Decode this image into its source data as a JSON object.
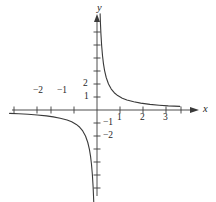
{
  "figure": {
    "background_color": "#ffffff",
    "stroke_color": "#3a3a3a",
    "text_color": "#262626"
  },
  "axes": {
    "x_axis_label": "x",
    "y_axis_label": "y",
    "origin_px": {
      "x": 97,
      "y": 110
    },
    "unit_px": {
      "x": 23.0,
      "y": 13.0
    },
    "x_ticks": [
      {
        "value": -3.6,
        "label": ""
      },
      {
        "value": -2.6,
        "label": ""
      },
      {
        "value": -2,
        "label": "−2"
      },
      {
        "value": -1,
        "label": "−1"
      },
      {
        "value": 1,
        "label": "1"
      },
      {
        "value": 2,
        "label": "2"
      },
      {
        "value": 3,
        "label": "3"
      },
      {
        "value": 3.65,
        "label": ""
      }
    ],
    "y_ticks": [
      {
        "value": 6,
        "label": ""
      },
      {
        "value": 5,
        "label": ""
      },
      {
        "value": 4,
        "label": ""
      },
      {
        "value": 3,
        "label": ""
      },
      {
        "value": 2,
        "label": "2"
      },
      {
        "value": 1,
        "label": "1"
      },
      {
        "value": -1,
        "label": "−1"
      },
      {
        "value": -2,
        "label": "−2"
      },
      {
        "value": -3,
        "label": ""
      },
      {
        "value": -4,
        "label": ""
      },
      {
        "value": -5,
        "label": ""
      },
      {
        "value": -6,
        "label": ""
      }
    ]
  },
  "chart_data": {
    "type": "line",
    "title": "",
    "subtitle": "",
    "xlabel": "x",
    "ylabel": "y",
    "xlim": [
      -4.2,
      4.6
    ],
    "ylim": [
      -7.3,
      7.3
    ],
    "grid": false,
    "legend": null,
    "axis_style": "cartesian-arrows",
    "function": "y = 1/x",
    "series": [
      {
        "name": "right-branch",
        "comment": "upper-right hyperbola branch, x > 0, asymptotic to both axes",
        "x": [
          0.135,
          0.15,
          0.17,
          0.2,
          0.24,
          0.28,
          0.33,
          0.4,
          0.5,
          0.62,
          0.75,
          0.9,
          1.1,
          1.3,
          1.6,
          1.9,
          2.3,
          2.7,
          3.1,
          3.6
        ],
        "y": [
          7.4,
          6.67,
          5.88,
          5.0,
          4.17,
          3.57,
          3.03,
          2.5,
          2.0,
          1.61,
          1.33,
          1.11,
          0.91,
          0.77,
          0.63,
          0.53,
          0.43,
          0.37,
          0.32,
          0.28
        ]
      },
      {
        "name": "left-branch",
        "comment": "lower-left hyperbola branch, x < 0, asymptotic to both axes",
        "x": [
          -3.8,
          -3.4,
          -3.0,
          -2.6,
          -2.2,
          -1.9,
          -1.6,
          -1.3,
          -1.1,
          -0.9,
          -0.75,
          -0.62,
          -0.5,
          -0.4,
          -0.33,
          -0.28,
          -0.24,
          -0.2,
          -0.17,
          -0.15,
          -0.135
        ],
        "y": [
          -0.26,
          -0.29,
          -0.33,
          -0.38,
          -0.45,
          -0.53,
          -0.63,
          -0.77,
          -0.91,
          -1.11,
          -1.33,
          -1.61,
          -2.0,
          -2.5,
          -3.03,
          -3.57,
          -4.17,
          -5.0,
          -5.88,
          -6.67,
          -7.4
        ]
      }
    ],
    "x_tick_labels": [
      "−2",
      "−1",
      "1",
      "2",
      "3"
    ],
    "y_tick_labels": [
      "2",
      "1",
      "−1",
      "−2"
    ]
  }
}
